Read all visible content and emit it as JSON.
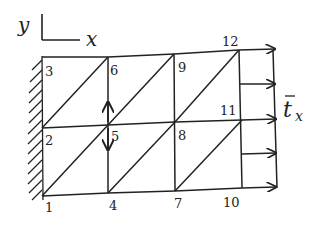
{
  "diagram": {
    "type": "finite-element-mesh",
    "axes": {
      "y_label": "y",
      "x_label": "x"
    },
    "load": {
      "label_main": "t",
      "label_sub": "x",
      "overbar": true,
      "direction": "+x"
    },
    "nodes": [
      {
        "id": "1",
        "x": 42,
        "y": 196
      },
      {
        "id": "2",
        "x": 42,
        "y": 128
      },
      {
        "id": "3",
        "x": 42,
        "y": 57
      },
      {
        "id": "4",
        "x": 108,
        "y": 193
      },
      {
        "id": "5",
        "x": 108,
        "y": 125
      },
      {
        "id": "6",
        "x": 108,
        "y": 57
      },
      {
        "id": "7",
        "x": 175,
        "y": 191
      },
      {
        "id": "8",
        "x": 175,
        "y": 122
      },
      {
        "id": "9",
        "x": 174,
        "y": 54
      },
      {
        "id": "10",
        "x": 242,
        "y": 188
      },
      {
        "id": "11",
        "x": 242,
        "y": 120
      },
      {
        "id": "12",
        "x": 239,
        "y": 50
      }
    ],
    "node_labels": {
      "n1": "1",
      "n2": "2",
      "n3": "3",
      "n4": "4",
      "n5": "5",
      "n6": "6",
      "n7": "7",
      "n8": "8",
      "n9": "9",
      "n10": "10",
      "n11": "11",
      "n12": "12"
    },
    "boundary_condition": "fixed wall (hatched) along left edge nodes 1-2-3",
    "node5_arrows": "vertical double arrow (up and down) at node 5",
    "traction_arrows_count": 5,
    "colors": {
      "ink": "#222222",
      "background": "#ffffff"
    }
  }
}
